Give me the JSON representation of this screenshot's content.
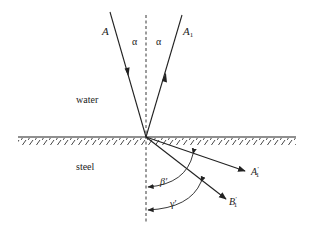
{
  "diagram": {
    "title": "",
    "media": {
      "upper": "water",
      "lower": "steel"
    },
    "rays": {
      "incident": {
        "label": "A",
        "direction": "toward interface"
      },
      "reflected": {
        "label": "A",
        "subscript": "1",
        "direction": "away from interface"
      },
      "refracted_longitudinal": {
        "label": "A",
        "prime": "′",
        "subscript": "1"
      },
      "refracted_transverse": {
        "label": "B",
        "prime": "′",
        "subscript": "1"
      }
    },
    "angles": {
      "incidence": "α",
      "reflection": "α",
      "refraction_longitudinal": "β′",
      "refraction_transverse": "γ′"
    },
    "normal_line": "dashed"
  }
}
